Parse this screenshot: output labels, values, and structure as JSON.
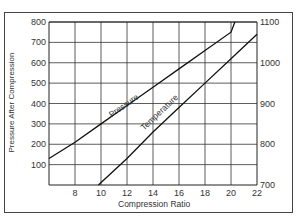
{
  "chart_data": {
    "type": "line",
    "title": "",
    "xlabel": "Compression Ratio",
    "ylabel": "Pressure After Compression",
    "ylabel_right": "",
    "xlim": [
      6,
      22
    ],
    "ylim": [
      0,
      800
    ],
    "ylim_right": [
      700,
      1100
    ],
    "x_ticks": [
      8,
      10,
      12,
      14,
      16,
      18,
      20,
      22
    ],
    "y_ticks": [
      100,
      200,
      300,
      400,
      500,
      600,
      700,
      800
    ],
    "y_ticks_right": [
      700,
      800,
      900,
      1000,
      1100
    ],
    "grid": true,
    "series": [
      {
        "name": "Pressure",
        "axis": "left",
        "x": [
          6,
          8,
          10,
          12,
          14,
          16,
          18,
          20,
          20.3
        ],
        "values": [
          130,
          210,
          300,
          390,
          480,
          570,
          660,
          750,
          800
        ]
      },
      {
        "name": "Temperature",
        "axis": "right",
        "x": [
          9.8,
          12,
          14,
          16,
          18,
          20,
          22
        ],
        "values": [
          700,
          765,
          830,
          890,
          950,
          1010,
          1070
        ]
      }
    ]
  }
}
